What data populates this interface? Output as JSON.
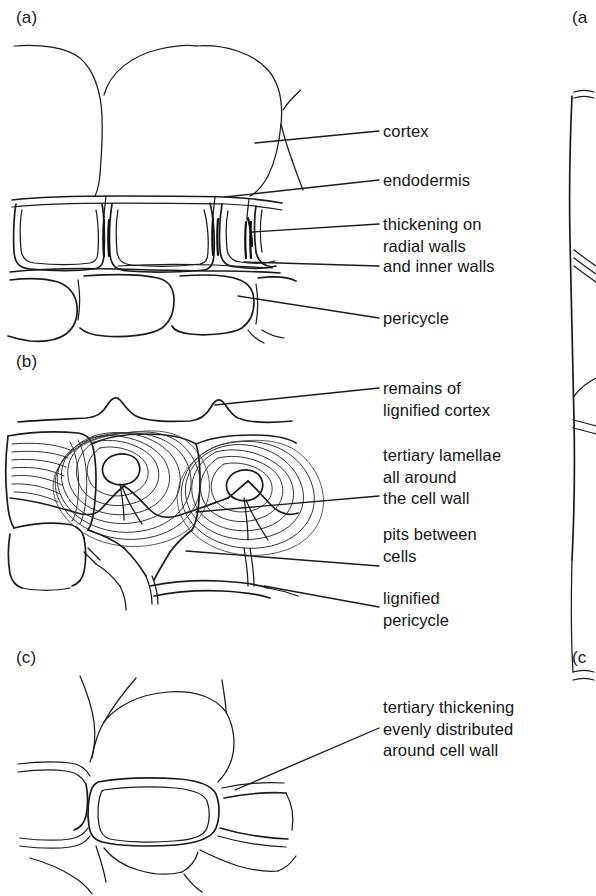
{
  "figure": {
    "kind": "botanical-line-drawing",
    "background_color": "#ffffff",
    "ink_color": "#1b1b1b"
  },
  "panels": [
    {
      "id": "a",
      "label": "(a)",
      "callouts": [
        {
          "id": "cortex",
          "text": "cortex"
        },
        {
          "id": "endodermis",
          "text": "endodermis"
        },
        {
          "id": "thickening-radial",
          "text": "thickening on\nradial walls"
        },
        {
          "id": "inner-walls",
          "text": "and inner walls"
        },
        {
          "id": "pericycle",
          "text": "pericycle"
        }
      ]
    },
    {
      "id": "b",
      "label": "(b)",
      "callouts": [
        {
          "id": "remains-cortex",
          "text": "remains of\nlignified cortex"
        },
        {
          "id": "tertiary-lamellae",
          "text": "tertiary lamellae\nall around\nthe cell wall"
        },
        {
          "id": "pits",
          "text": "pits between\ncells"
        },
        {
          "id": "lignified-pericycle",
          "text": "lignified\npericycle"
        }
      ]
    },
    {
      "id": "c",
      "label": "(c)",
      "callouts": [
        {
          "id": "tertiary-even",
          "text": "tertiary thickening\nevenly distributed\naround cell wall"
        }
      ]
    }
  ],
  "adjacent_figure": {
    "note": "sliver of neighbouring figure cropped at right edge",
    "top_label": "(a",
    "bottom_label": "(c"
  }
}
